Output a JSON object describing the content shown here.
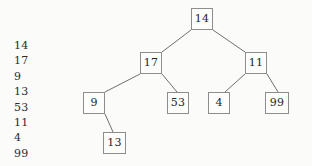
{
  "diagram": {
    "type": "binary-search-tree",
    "background_color": "#fbfbfa",
    "node_border_color": "#8d8d8d",
    "node_fill_color": "#fdfdfc",
    "edge_color": "#6f6f6f",
    "text_color": "#252525"
  },
  "sequence": {
    "title": "insertion-sequence",
    "items": [
      "14",
      "17",
      "9",
      "13",
      "53",
      "11",
      "4",
      "99"
    ]
  },
  "tree": {
    "nodes": [
      {
        "id": "n14",
        "label": "14",
        "x": 191,
        "y": 8,
        "w": 22,
        "h": 22,
        "level": 0,
        "role": "root"
      },
      {
        "id": "n17",
        "label": "17",
        "x": 140,
        "y": 52,
        "w": 22,
        "h": 22,
        "level": 1,
        "role": "left-child-of-14"
      },
      {
        "id": "n11",
        "label": "11",
        "x": 245,
        "y": 52,
        "w": 22,
        "h": 22,
        "level": 1,
        "role": "right-child-of-14"
      },
      {
        "id": "n9",
        "label": "9",
        "x": 83,
        "y": 92,
        "w": 22,
        "h": 22,
        "level": 2,
        "role": "left-child-of-17"
      },
      {
        "id": "n53",
        "label": "53",
        "x": 167,
        "y": 92,
        "w": 22,
        "h": 22,
        "level": 2,
        "role": "right-child-of-17"
      },
      {
        "id": "n4",
        "label": "4",
        "x": 208,
        "y": 92,
        "w": 22,
        "h": 22,
        "level": 2,
        "role": "left-child-of-11"
      },
      {
        "id": "n99",
        "label": "99",
        "x": 265,
        "y": 92,
        "w": 24,
        "h": 22,
        "level": 2,
        "role": "right-child-of-11"
      },
      {
        "id": "n13",
        "label": "13",
        "x": 103,
        "y": 132,
        "w": 23,
        "h": 22,
        "level": 3,
        "role": "right-child-of-9"
      }
    ],
    "edges": [
      {
        "id": "e14-17",
        "from": "n14",
        "to": "n17",
        "x1": 191,
        "y1": 30,
        "x2": 162,
        "y2": 52
      },
      {
        "id": "e14-11",
        "from": "n14",
        "to": "n11",
        "x1": 213,
        "y1": 30,
        "x2": 245,
        "y2": 52
      },
      {
        "id": "e17-9",
        "from": "n17",
        "to": "n9",
        "x1": 140,
        "y1": 74,
        "x2": 105,
        "y2": 92
      },
      {
        "id": "e17-53",
        "from": "n17",
        "to": "n53",
        "x1": 162,
        "y1": 74,
        "x2": 177,
        "y2": 92
      },
      {
        "id": "e11-4",
        "from": "n11",
        "to": "n4",
        "x1": 245,
        "y1": 74,
        "x2": 225,
        "y2": 92
      },
      {
        "id": "e11-99",
        "from": "n11",
        "to": "n99",
        "x1": 267,
        "y1": 74,
        "x2": 278,
        "y2": 92
      },
      {
        "id": "e9-13",
        "from": "n9",
        "to": "n13",
        "x1": 105,
        "y1": 114,
        "x2": 113,
        "y2": 132
      }
    ]
  }
}
